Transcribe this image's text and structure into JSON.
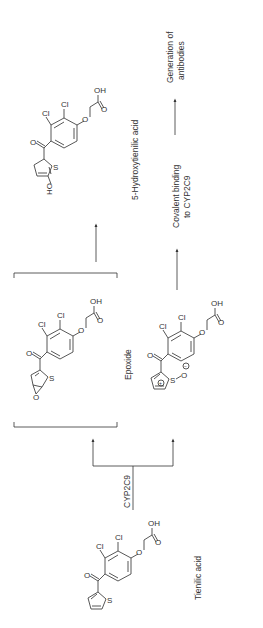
{
  "figure": {
    "orientation": "rotated 90 degrees counter-clockwise",
    "enzyme": "CYP2C9",
    "compounds": {
      "tienilic_acid": {
        "name": "Tienilic acid"
      },
      "epoxide": {
        "name": "Epoxide"
      },
      "hydroxy": {
        "name": "5-Hydroxytienilic acid"
      },
      "sulfoxide": {
        "name": ""
      }
    },
    "outcomes": {
      "covalent_line1": "Covalent binding",
      "covalent_line2": "to CYP2C9",
      "antibodies_line1": "Generation of",
      "antibodies_line2": "antibodies"
    },
    "atoms": {
      "cl": "Cl",
      "o": "O",
      "oh": "OH",
      "ho": "HO",
      "s": "S",
      "plus": "+",
      "minus": "−"
    }
  }
}
